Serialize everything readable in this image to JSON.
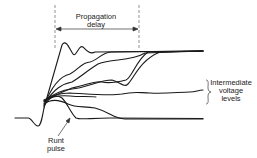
{
  "diagram": {
    "type": "waveform-annotation",
    "labels": {
      "propagation_line1": "Propagation",
      "propagation_line2": "delay",
      "intermediate_line1": "Intermediate",
      "intermediate_line2": "voltage",
      "intermediate_line3": "levels",
      "runt_line1": "Runt",
      "runt_line2": "pulse"
    },
    "colors": {
      "stroke": "#1a1a1a",
      "dashed": "#777777",
      "background": "#ffffff"
    }
  }
}
